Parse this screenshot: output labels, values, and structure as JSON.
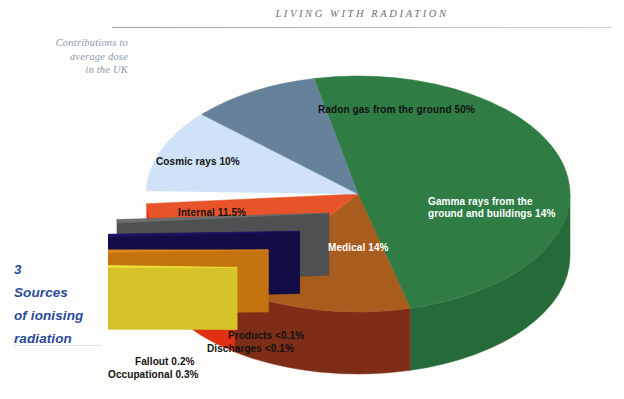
{
  "header": {
    "running_head": "LIVING WITH RADIATION"
  },
  "margin": {
    "caption": "Contributions to average dose in the UK",
    "caption_lines": [
      "Contributions to",
      "average dose",
      "in the UK"
    ],
    "chapter_number": "3",
    "chapter_title_lines": [
      "Sources",
      "of ionising",
      "radiation"
    ]
  },
  "chart_data": {
    "type": "pie",
    "title": "Contributions to average dose in the UK",
    "style": "3d-exploded-pie",
    "unit": "%",
    "legend": "none",
    "labels_on_slices": true,
    "categories": [
      "Radon gas from the ground",
      "Gamma rays from the ground and buildings",
      "Medical",
      "Products",
      "Discharges",
      "Fallout",
      "Occupational",
      "Internal",
      "Cosmic rays"
    ],
    "values": [
      50,
      14,
      14,
      0.05,
      0.05,
      0.2,
      0.3,
      11.5,
      10
    ],
    "value_labels": [
      "50%",
      "14%",
      "14%",
      "<0.1%",
      "<0.1%",
      "0.2%",
      "0.3%",
      "11.5%",
      "10%"
    ],
    "colors": [
      "#2f7d45",
      "#a85c1e",
      "#e8542a",
      "#6d6e70",
      "#1b1464",
      "#e08a1e",
      "#f2e03c",
      "#cfe2f7",
      "#66829a"
    ],
    "side_colors": [
      "#256b39",
      "#7e2d16",
      "#e03210",
      "#4f5052",
      "#120d47",
      "#c4740f",
      "#d6c32a",
      "#2f6fd0",
      "#4d6a82"
    ],
    "slices": [
      {
        "name": "Radon gas from the ground",
        "value": 50,
        "label": "Radon gas from the ground 50%",
        "color": "#2f7d45",
        "label_color": "dark",
        "exploded": false
      },
      {
        "name": "Gamma rays from the ground and buildings",
        "value": 14,
        "label": "Gamma rays from the ground and buildings 14%",
        "color": "#a85c1e",
        "label_color": "light",
        "exploded": false
      },
      {
        "name": "Medical",
        "value": 14,
        "label": "Medical 14%",
        "color": "#e8542a",
        "label_color": "light",
        "exploded": false
      },
      {
        "name": "Products",
        "value": 0.05,
        "label": "Products <0.1%",
        "color": "#6d6e70",
        "label_color": "dark",
        "exploded": true
      },
      {
        "name": "Discharges",
        "value": 0.05,
        "label": "Discharges <0.1%",
        "color": "#1b1464",
        "label_color": "dark",
        "exploded": true
      },
      {
        "name": "Fallout",
        "value": 0.2,
        "label": "Fallout 0.2%",
        "color": "#e08a1e",
        "label_color": "dark",
        "exploded": true
      },
      {
        "name": "Occupational",
        "value": 0.3,
        "label": "Occupational 0.3%",
        "color": "#f2e03c",
        "label_color": "dark",
        "exploded": true
      },
      {
        "name": "Internal",
        "value": 11.5,
        "label": "Internal 11.5%",
        "color": "#cfe2f7",
        "label_color": "dark",
        "exploded": false
      },
      {
        "name": "Cosmic rays",
        "value": 10,
        "label": "Cosmic rays 10%",
        "color": "#66829a",
        "label_color": "dark",
        "exploded": false
      }
    ]
  },
  "slice_labels": {
    "radon": "Radon gas from the ground 50%",
    "gamma_line1": "Gamma rays from the",
    "gamma_line2": "ground and buildings 14%",
    "medical": "Medical 14%",
    "internal": "Internal 11.5%",
    "cosmic": "Cosmic rays 10%",
    "products": "Products  <0.1%",
    "discharges": "Discharges  <0.1%",
    "fallout": "Fallout 0.2%",
    "occupational": "Occupational 0.3%"
  }
}
